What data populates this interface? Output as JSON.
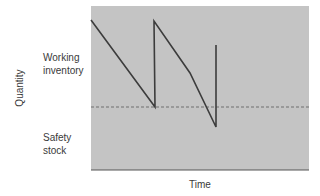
{
  "chart_data": {
    "type": "line",
    "title": "",
    "xlabel": "Time",
    "ylabel": "Quantity",
    "grid": false,
    "legend": null,
    "annotations": [
      {
        "text": "Working\ninventory",
        "line1": "Working",
        "line2": "inventory",
        "region": "above safety stock line"
      },
      {
        "text": "Safety\nstock",
        "line1": "Safety",
        "line2": "stock",
        "region": "below safety stock line"
      }
    ],
    "reference_lines": [
      {
        "name": "safety-stock-level",
        "style": "dashed",
        "y_pixel": 107
      }
    ],
    "series": [
      {
        "name": "inventory-level",
        "points_pixel": [
          [
            91,
            20
          ],
          [
            155,
            107
          ],
          [
            154,
            21
          ],
          [
            190,
            73
          ],
          [
            216,
            127
          ],
          [
            216,
            45
          ]
        ]
      }
    ],
    "plot_area": {
      "x": 91,
      "y": 6,
      "width": 218,
      "height": 164
    },
    "colors": {
      "plot_fill": "#c4c4c4",
      "line": "#3c3c3c",
      "dashed": "#6e6e6e",
      "axis": "#555555"
    }
  }
}
